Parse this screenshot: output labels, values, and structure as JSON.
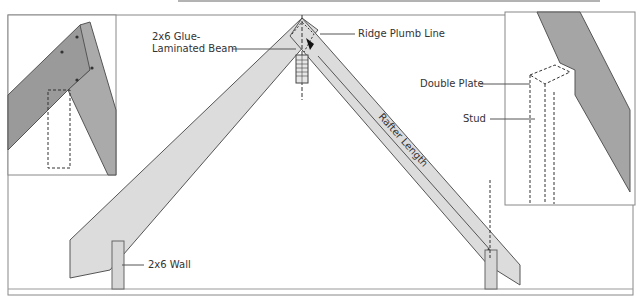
{
  "diagram": {
    "labels": {
      "ridge_plumb_line": "Ridge Plumb Line",
      "glue_lam_line1": "2x6 Glue-",
      "glue_lam_line2": "Laminated Beam",
      "double_plate": "Double Plate",
      "stud": "Stud",
      "rafter_length": "Rafter Length",
      "wall": "2x6 Wall"
    },
    "insets": [
      {
        "name": "ridge-detail-inset",
        "position": "left"
      },
      {
        "name": "wall-plate-detail-inset",
        "position": "right"
      }
    ],
    "colors": {
      "wood_light": "#d9d9d9",
      "wood_dark": "#8f8f8f",
      "line": "#444444",
      "background": "#ffffff"
    }
  }
}
